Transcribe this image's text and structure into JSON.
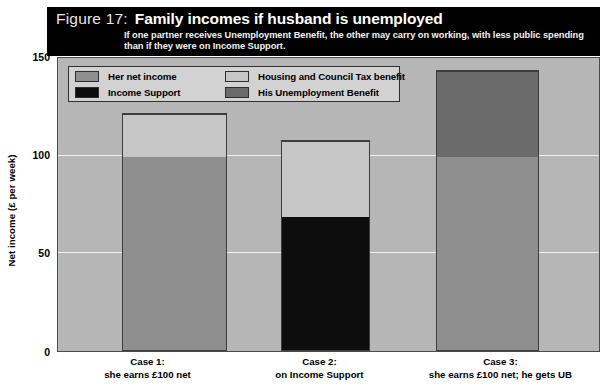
{
  "figure": {
    "number_label": "Figure 17:",
    "title": "Family incomes if husband is unemployed",
    "subtitle": "If one partner receives Unemployment Benefit, the other may carry on working, with less public spending than if they were on Income Support."
  },
  "legend": {
    "items": [
      {
        "label": "Her net income",
        "color": "#8f8f8f"
      },
      {
        "label": "Income Support",
        "color": "#0d0d0d"
      },
      {
        "label": "Housing and Council Tax benefit",
        "color": "#c6c6c6"
      },
      {
        "label": "His Unemployment Benefit",
        "color": "#6b6b6b"
      }
    ]
  },
  "axes": {
    "y_label": "Net income (£ per week)",
    "y_ticks": [
      "0",
      "50",
      "100",
      "150"
    ],
    "x_categories": [
      {
        "line1": "Case 1:",
        "line2": "she earns £100 net"
      },
      {
        "line1": "Case 2:",
        "line2": "on Income Support"
      },
      {
        "line1": "Case 3:",
        "line2": "she earns £100 net; he gets UB"
      }
    ]
  },
  "chart_data": {
    "type": "bar",
    "stacked": true,
    "title": "Family incomes if husband is unemployed",
    "subtitle": "If one partner receives Unemployment Benefit, the other may carry on working, with less public spending than if they were on Income Support.",
    "xlabel": "",
    "ylabel": "Net income (£ per week)",
    "ylim": [
      0,
      150
    ],
    "yticks": [
      0,
      50,
      100,
      150
    ],
    "grid": true,
    "legend_position": "inside-top-left",
    "categories": [
      "Case 1: she earns £100 net",
      "Case 2: on Income Support",
      "Case 3: she earns £100 net; he gets UB"
    ],
    "series": [
      {
        "name": "Her net income",
        "color": "#8f8f8f",
        "values": [
          100,
          0,
          100
        ]
      },
      {
        "name": "Income Support",
        "color": "#0d0d0d",
        "values": [
          0,
          69,
          0
        ]
      },
      {
        "name": "Housing and Council Tax benefit",
        "color": "#c6c6c6",
        "values": [
          22,
          39,
          0
        ]
      },
      {
        "name": "His Unemployment Benefit",
        "color": "#6b6b6b",
        "values": [
          0,
          0,
          44
        ]
      }
    ],
    "totals": [
      122,
      108,
      144
    ]
  },
  "render": {
    "bars": [
      {
        "left_pct": 11.9,
        "width_pct": 19.4,
        "segments": [
          {
            "series": "Her net income",
            "value": 100,
            "color": "#8f8f8f"
          },
          {
            "series": "Housing and Council Tax benefit",
            "value": 22,
            "color": "#c6c6c6"
          }
        ]
      },
      {
        "left_pct": 41.2,
        "width_pct": 16.4,
        "segments": [
          {
            "series": "Income Support",
            "value": 69,
            "color": "#0d0d0d"
          },
          {
            "series": "Housing and Council Tax benefit",
            "value": 39,
            "color": "#c6c6c6"
          }
        ]
      },
      {
        "left_pct": 69.8,
        "width_pct": 19.2,
        "segments": [
          {
            "series": "Her net income",
            "value": 100,
            "color": "#8f8f8f"
          },
          {
            "series": "His Unemployment Benefit",
            "value": 44,
            "color": "#6b6b6b"
          }
        ]
      }
    ]
  }
}
